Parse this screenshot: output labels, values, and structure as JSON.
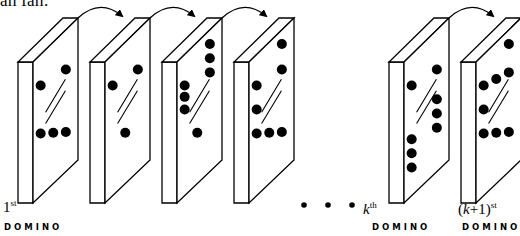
{
  "caption_fragment": "all fall.",
  "geometry": {
    "front_top_y": 62,
    "back_top_y": 18,
    "front_bottom_y": 203,
    "back_bottom_y": 160,
    "edge_width": 15,
    "depth_dx": 45,
    "stroke_color": "#000000",
    "fill_color": "#ffffff",
    "dot_color": "#000000",
    "dot_radius": 5
  },
  "dominoes": [
    {
      "id": "domino-1",
      "left": 18,
      "top_dots": [
        [
          0.17,
          0.22
        ],
        [
          0.73,
          0.28
        ]
      ],
      "bottom_dots": [
        [
          0.17,
          0.56
        ],
        [
          0.45,
          0.64
        ],
        [
          0.73,
          0.72
        ]
      ]
    },
    {
      "id": "domino-2",
      "left": 90,
      "top_dots": [
        [
          0.17,
          0.22
        ],
        [
          0.73,
          0.28
        ]
      ],
      "bottom_dots": [
        [
          0.45,
          0.64
        ]
      ]
    },
    {
      "id": "domino-3",
      "left": 162,
      "top_dots": [
        [
          0.73,
          0.1
        ],
        [
          0.17,
          0.22
        ],
        [
          0.73,
          0.2
        ],
        [
          0.17,
          0.3
        ],
        [
          0.73,
          0.3
        ],
        [
          0.17,
          0.39
        ]
      ],
      "bottom_dots": [
        [
          0.45,
          0.64
        ]
      ]
    },
    {
      "id": "domino-4",
      "left": 234,
      "top_dots": [
        [
          0.73,
          0.1
        ],
        [
          0.17,
          0.22
        ],
        [
          0.73,
          0.28
        ]
      ],
      "bottom_dots": [
        [
          0.17,
          0.39
        ],
        [
          0.17,
          0.56
        ],
        [
          0.45,
          0.64
        ],
        [
          0.73,
          0.72
        ]
      ]
    },
    {
      "id": "domino-k",
      "left": 389,
      "top_dots": [
        [
          0.17,
          0.22
        ],
        [
          0.73,
          0.28
        ]
      ],
      "bottom_dots": [
        [
          0.73,
          0.49
        ],
        [
          0.73,
          0.59
        ],
        [
          0.73,
          0.69
        ],
        [
          0.17,
          0.6
        ],
        [
          0.17,
          0.7
        ],
        [
          0.17,
          0.8
        ]
      ]
    },
    {
      "id": "domino-k-plus-1",
      "left": 461,
      "top_dots": [
        [
          0.73,
          0.1
        ],
        [
          0.17,
          0.22
        ],
        [
          0.45,
          0.26
        ],
        [
          0.73,
          0.3
        ]
      ],
      "bottom_dots": [
        [
          0.17,
          0.39
        ],
        [
          0.17,
          0.56
        ],
        [
          0.45,
          0.64
        ],
        [
          0.73,
          0.72
        ]
      ]
    }
  ],
  "arrows": [
    {
      "from": [
        78,
        18
      ],
      "to": [
        122,
        16
      ]
    },
    {
      "from": [
        150,
        18
      ],
      "to": [
        194,
        16
      ]
    },
    {
      "from": [
        222,
        18
      ],
      "to": [
        266,
        16
      ]
    },
    {
      "from": [
        449,
        18
      ],
      "to": [
        493,
        16
      ]
    }
  ],
  "ellipsis_dots": [
    [
      304,
      205
    ],
    [
      328,
      205
    ],
    [
      352,
      205
    ]
  ],
  "labels": [
    {
      "id": "first",
      "x": 3,
      "y": 198,
      "number": "1",
      "italic": false,
      "suffix": "st",
      "domino_label": "DOMINO",
      "domino_x": 4
    },
    {
      "id": "kth",
      "x": 363,
      "y": 200,
      "number": "k",
      "italic": true,
      "suffix": "th",
      "domino_label": "DOMINO",
      "domino_x": 372
    },
    {
      "id": "k-plus-1",
      "x": 458,
      "y": 200,
      "number": "(k+1)",
      "italic": "partial",
      "suffix": "st",
      "domino_label": "DOMINO",
      "domino_x": 462
    }
  ]
}
